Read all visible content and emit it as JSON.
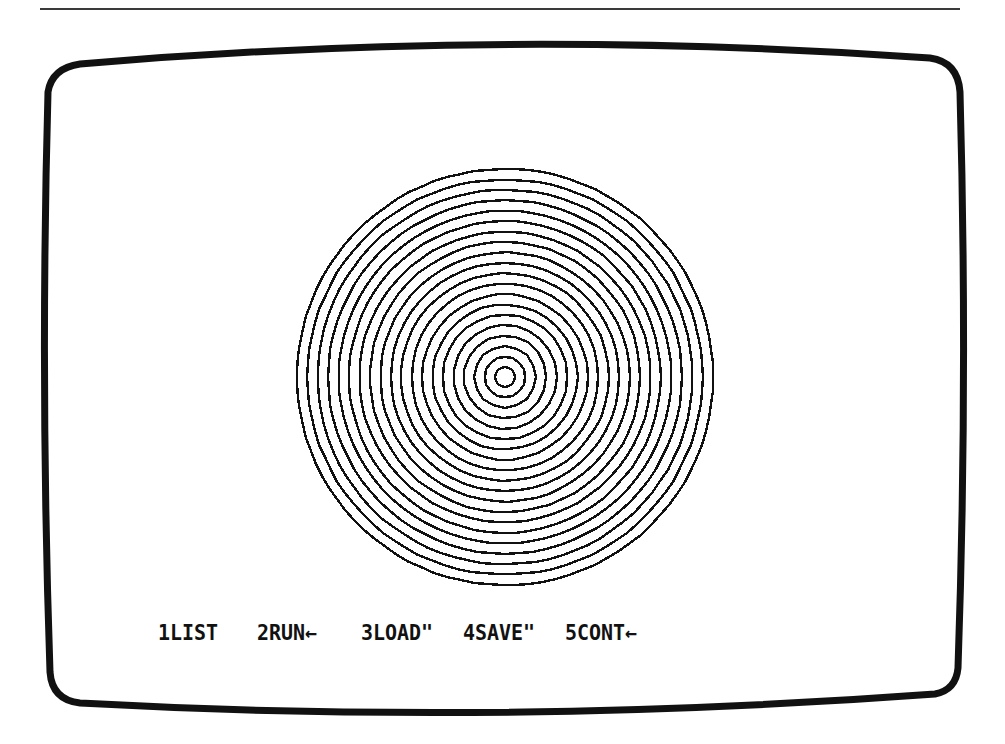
{
  "screen": {
    "type": "crt-monitor",
    "graphic": {
      "name": "concentric-circles",
      "center": [
        505,
        377
      ],
      "ring_count": 20,
      "inner_radius": 10,
      "outer_radius": 208,
      "stroke_color": "#111111"
    },
    "function_keys": [
      {
        "key": "1",
        "label": "1LIST"
      },
      {
        "key": "2",
        "label": "2RUN←"
      },
      {
        "key": "3",
        "label": "3LOAD\""
      },
      {
        "key": "4",
        "label": "4SAVE\""
      },
      {
        "key": "5",
        "label": "5CONT←"
      }
    ]
  },
  "colors": {
    "background": "#ffffff",
    "ink": "#111111"
  }
}
